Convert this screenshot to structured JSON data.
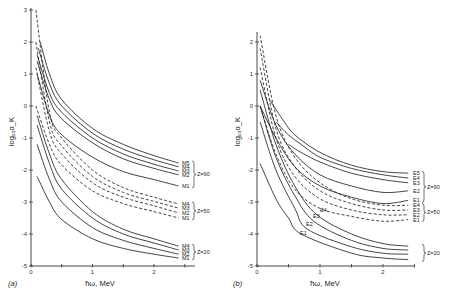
{
  "chart_data": [
    {
      "panel": "(a)",
      "type": "line",
      "title": "",
      "xlabel": "ħω, MeV",
      "ylabel": "log₁₀α_K",
      "xlim": [
        0,
        2.6
      ],
      "ylim": [
        -5,
        3
      ],
      "xticks": [
        "0",
        "1",
        "2"
      ],
      "yticks": [
        "3",
        "2",
        "1",
        "0",
        "-1",
        "-2",
        "-3",
        "-4",
        "-5"
      ],
      "grid": false,
      "legend_position": "right (curve-end labels with braces)",
      "groups": [
        {
          "label": "Z=90",
          "style": "solid",
          "series": [
            {
              "name": "M5",
              "x": [
                0.15,
                0.3,
                0.5,
                1.0,
                1.5,
                2.0,
                2.4
              ],
              "values": [
                2.0,
                1.0,
                0.2,
                -0.7,
                -1.2,
                -1.55,
                -1.78
              ]
            },
            {
              "name": "M4",
              "x": [
                0.12,
                0.3,
                0.5,
                1.0,
                1.5,
                2.0,
                2.4
              ],
              "values": [
                1.8,
                0.7,
                0.0,
                -0.85,
                -1.35,
                -1.68,
                -1.9
              ]
            },
            {
              "name": "M3",
              "x": [
                0.1,
                0.3,
                0.5,
                1.0,
                1.5,
                2.0,
                2.4
              ],
              "values": [
                1.6,
                0.4,
                -0.2,
                -1.0,
                -1.5,
                -1.82,
                -2.03
              ]
            },
            {
              "name": "M2",
              "x": [
                0.1,
                0.3,
                0.5,
                1.0,
                1.5,
                2.0,
                2.4
              ],
              "values": [
                1.4,
                0.2,
                -0.4,
                -1.15,
                -1.65,
                -1.95,
                -2.15
              ]
            },
            {
              "name": "M1",
              "x": [
                0.1,
                0.3,
                0.5,
                1.0,
                1.5,
                2.0,
                2.4
              ],
              "values": [
                1.0,
                -0.3,
                -0.9,
                -1.6,
                -2.05,
                -2.3,
                -2.5
              ]
            }
          ]
        },
        {
          "label": "Z=50",
          "style": "dashed",
          "series": [
            {
              "name": "M4",
              "x": [
                0.08,
                0.3,
                0.5,
                1.0,
                1.5,
                2.0,
                2.4
              ],
              "values": [
                3.0,
                -0.2,
                -1.0,
                -2.0,
                -2.55,
                -2.85,
                -3.06
              ]
            },
            {
              "name": "M3",
              "x": [
                0.08,
                0.3,
                0.5,
                1.0,
                1.5,
                2.0,
                2.4
              ],
              "values": [
                2.0,
                -0.5,
                -1.25,
                -2.2,
                -2.7,
                -2.98,
                -3.19
              ]
            },
            {
              "name": "M2",
              "x": [
                0.08,
                0.3,
                0.5,
                1.0,
                1.5,
                2.0,
                2.4
              ],
              "values": [
                1.2,
                -0.8,
                -1.5,
                -2.4,
                -2.85,
                -3.12,
                -3.34
              ]
            },
            {
              "name": "M1",
              "x": [
                0.08,
                0.3,
                0.5,
                1.0,
                1.5,
                2.0,
                2.4
              ],
              "values": [
                0.0,
                -1.2,
                -1.85,
                -2.65,
                -3.05,
                -3.3,
                -3.5
              ]
            }
          ]
        },
        {
          "label": "Z=20",
          "style": "solid",
          "series": [
            {
              "name": "M4",
              "x": [
                0.1,
                0.3,
                0.5,
                1.0,
                1.5,
                2.0,
                2.4
              ],
              "values": [
                -0.3,
                -1.5,
                -2.3,
                -3.3,
                -3.85,
                -4.15,
                -4.38
              ]
            },
            {
              "name": "M3",
              "x": [
                0.1,
                0.3,
                0.5,
                1.0,
                1.5,
                2.0,
                2.4
              ],
              "values": [
                -0.6,
                -1.8,
                -2.6,
                -3.5,
                -4.0,
                -4.28,
                -4.5
              ]
            },
            {
              "name": "M2",
              "x": [
                0.1,
                0.3,
                0.5,
                1.0,
                1.5,
                2.0,
                2.4
              ],
              "values": [
                -1.2,
                -2.3,
                -3.0,
                -3.8,
                -4.2,
                -4.45,
                -4.63
              ]
            },
            {
              "name": "M1",
              "x": [
                0.1,
                0.3,
                0.5,
                1.0,
                1.5,
                2.0,
                2.4
              ],
              "values": [
                -2.2,
                -3.0,
                -3.55,
                -4.15,
                -4.45,
                -4.63,
                -4.75
              ]
            }
          ]
        }
      ]
    },
    {
      "panel": "(b)",
      "type": "line",
      "title": "",
      "xlabel": "ħω, MeV",
      "ylabel": "log₁₀α_K",
      "xlim": [
        0,
        2.6
      ],
      "ylim": [
        -5,
        2.3
      ],
      "xticks": [
        "0",
        "1",
        "2"
      ],
      "yticks": [
        "2",
        "1",
        "0",
        "-1",
        "-2",
        "-3",
        "-4",
        "-5"
      ],
      "grid": false,
      "legend_position": "right (curve-end labels with braces)",
      "groups": [
        {
          "label": "Z=90",
          "style": "solid",
          "series": [
            {
              "name": "E5",
              "x": [
                0.2,
                0.4,
                0.6,
                1.0,
                1.5,
                2.0,
                2.4
              ],
              "values": [
                0.2,
                -0.4,
                -0.9,
                -1.45,
                -1.85,
                -2.05,
                -2.1
              ]
            },
            {
              "name": "E4",
              "x": [
                0.3,
                0.5,
                0.7,
                1.0,
                1.5,
                2.0,
                2.4
              ],
              "values": [
                -0.5,
                -0.9,
                -1.2,
                -1.6,
                -1.95,
                -2.15,
                -2.25
              ]
            },
            {
              "name": "E3",
              "x": [
                0.5,
                0.7,
                1.0,
                1.5,
                2.0,
                2.4
              ],
              "values": [
                -1.2,
                -1.45,
                -1.75,
                -2.1,
                -2.3,
                -2.4
              ]
            },
            {
              "name": "E2",
              "x": [
                0.05,
                0.3,
                0.6,
                1.0,
                1.5,
                2.0,
                2.4
              ],
              "values": [
                0.8,
                -0.6,
                -1.5,
                -2.15,
                -2.5,
                -2.7,
                -2.65
              ]
            },
            {
              "name": "E1",
              "x": [
                0.05,
                0.3,
                0.6,
                1.0,
                1.5,
                2.0,
                2.4
              ],
              "values": [
                0.0,
                -1.0,
                -1.9,
                -2.5,
                -2.85,
                -3.05,
                -2.95
              ]
            }
          ]
        },
        {
          "label": "Z=50",
          "style": "dashed",
          "series": [
            {
              "name": "E4",
              "x": [
                0.05,
                0.3,
                0.6,
                1.0,
                1.5,
                2.0,
                2.4
              ],
              "values": [
                2.2,
                -0.3,
                -1.6,
                -2.4,
                -2.9,
                -3.1,
                -3.1
              ]
            },
            {
              "name": "E3",
              "x": [
                0.05,
                0.3,
                0.6,
                1.0,
                1.5,
                2.0,
                2.4
              ],
              "values": [
                1.8,
                -0.7,
                -1.9,
                -2.65,
                -3.05,
                -3.25,
                -3.25
              ]
            },
            {
              "name": "E2",
              "x": [
                0.05,
                0.3,
                0.6,
                1.0,
                1.5,
                2.0,
                2.4
              ],
              "values": [
                1.2,
                -1.0,
                -2.2,
                -2.9,
                -3.25,
                -3.4,
                -3.4
              ]
            },
            {
              "name": "E1",
              "x": [
                0.05,
                0.3,
                0.6,
                1.0,
                1.5,
                2.0,
                2.4
              ],
              "values": [
                0.0,
                -1.5,
                -2.6,
                -3.2,
                -3.45,
                -3.6,
                -3.55
              ]
            }
          ]
        },
        {
          "label": "Z=20",
          "style": "solid",
          "series": [
            {
              "name": "E4",
              "x": [
                0.05,
                0.3,
                0.6,
                0.95,
                1.5,
                2.0,
                2.4
              ],
              "values": [
                0.5,
                -1.2,
                -2.5,
                -3.4,
                -4.0,
                -4.3,
                -4.38
              ]
            },
            {
              "name": "E3",
              "x": [
                0.05,
                0.3,
                0.6,
                0.9,
                1.5,
                2.0,
                2.4
              ],
              "values": [
                0.0,
                -1.6,
                -2.8,
                -3.6,
                -4.2,
                -4.45,
                -4.5
              ]
            },
            {
              "name": "E2",
              "x": [
                0.05,
                0.3,
                0.6,
                0.8,
                1.5,
                2.0,
                2.4
              ],
              "values": [
                -0.5,
                -2.0,
                -3.2,
                -3.85,
                -4.4,
                -4.6,
                -4.63
              ]
            },
            {
              "name": "E1",
              "x": [
                0.05,
                0.3,
                0.5,
                0.7,
                1.5,
                2.0,
                2.4
              ],
              "values": [
                -1.8,
                -2.9,
                -3.5,
                -4.0,
                -4.6,
                -4.75,
                -4.8
              ]
            }
          ]
        }
      ],
      "annotations": [
        "E1",
        "E2",
        "E3",
        "E4"
      ]
    }
  ],
  "labels": {
    "panel_a": "(a)",
    "panel_b": "(b)",
    "xlabel": "ħω, MeV",
    "ylabel": "log₁₀α_K",
    "z90": "Z=90",
    "z50": "Z=50",
    "z20": "Z=20"
  }
}
